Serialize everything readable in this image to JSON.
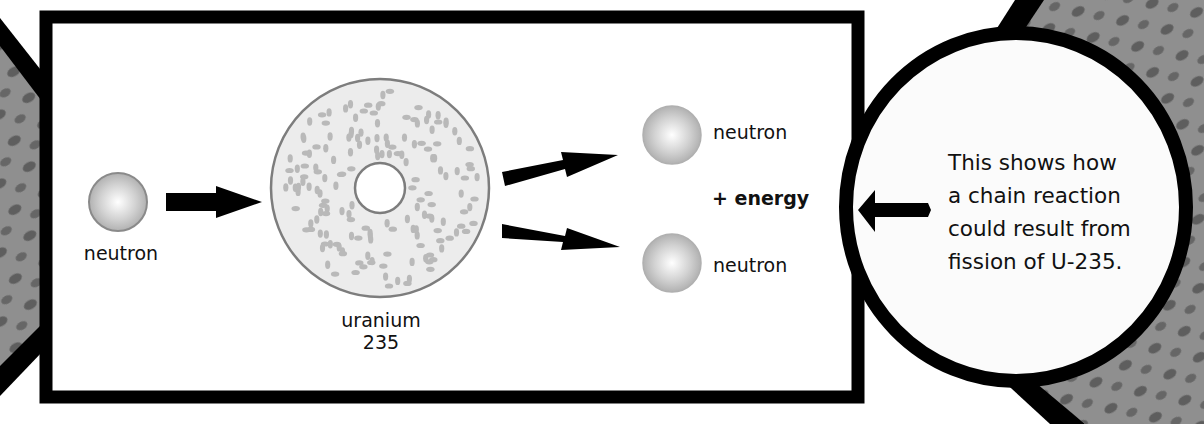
{
  "diagram": {
    "incoming_particle": {
      "label": "neutron"
    },
    "target_nucleus": {
      "label_line1": "uranium",
      "label_line2": "235"
    },
    "products": {
      "top_neutron_label": "neutron",
      "energy_label": "+ energy",
      "bottom_neutron_label": "neutron"
    },
    "callout": {
      "lines": [
        "This shows how",
        "a chain reaction",
        "could result from",
        "fission of U-235."
      ]
    },
    "colors": {
      "frame": "#000000",
      "panel_bg": "#ffffff",
      "background_wedge": "#8f8f8f",
      "wedge_blob": "#5e5e5e",
      "neutron_edge": "#8a8a8a",
      "neutron_light": "#ffffff",
      "neutron_mid": "#cfcfcf",
      "nucleus_fill": "#ececec",
      "nucleus_edge": "#7d7d7d",
      "nucleon_dot": "#b9b9b9",
      "text": "#111111"
    }
  }
}
